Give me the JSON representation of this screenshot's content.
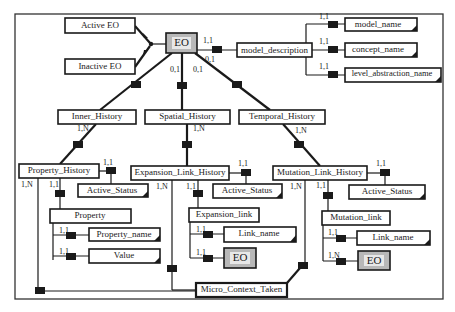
{
  "diagram": {
    "entities": {
      "eo_root": "EO",
      "active_eo": "Active EO",
      "inactive_eo": "Inactive EO",
      "model_description": "model_description",
      "model_name": "model_name",
      "concept_name": "concept_name",
      "level_abstraction_name": "level_abstraction_name",
      "inner_history": "Inner_History",
      "spatial_history": "Spatial_History",
      "temporal_history": "Temporal_History",
      "property_history": "Property_History",
      "expansion_link_history": "Expansion_Link_History",
      "mutation_link_history": "Mutation_Link_History",
      "active_status_1": "Active_Status",
      "active_status_2": "Active_Status",
      "active_status_3": "Active_Status",
      "property": "Property",
      "property_name": "Property_name",
      "value": "Value",
      "expansion_link": "Expansion_link",
      "link_name_1": "Link_name",
      "eo_expansion": "EO",
      "mutation_link": "Mutation_link",
      "link_name_2": "Link_name",
      "eo_mutation": "EO",
      "micro_context_taken": "Micro_Context_Taken"
    },
    "cardinalities": {
      "eo_to_md_top": "1,1",
      "eo_to_md_bottom": "0,1",
      "eo_inner": "0,1",
      "eo_spatial": "0,1",
      "md_model_name": "1,1",
      "md_concept_name": "1,1",
      "md_level": "1,1",
      "inner_ph": "1,N",
      "spatial_elh": "1,N",
      "temporal_mlh": "1,N",
      "ph_active": "1,1",
      "ph_micro": "1,N",
      "ph_property": "1,1",
      "elh_active": "1,1",
      "elh_micro": "1,N",
      "elh_link": "1,1",
      "mlh_active": "1,1",
      "mlh_micro": "1,N",
      "mlh_link": "1,1",
      "prop_name": "1,1",
      "prop_value": "1,1",
      "exp_linkname": "1,1",
      "exp_eo": "1,1",
      "mut_linkname": "1,1",
      "mut_eo": "1,N"
    }
  }
}
